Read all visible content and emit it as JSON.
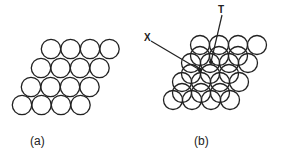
{
  "panels": [
    {
      "label": "(a)",
      "description": "single close-packed layer of spheres"
    },
    {
      "label": "(b)",
      "description": "two stacked close-packed layers"
    }
  ],
  "annotations": {
    "x_label": "X",
    "t_label": "T"
  },
  "colors": {
    "stroke": "#222222",
    "background": "#ffffff"
  }
}
